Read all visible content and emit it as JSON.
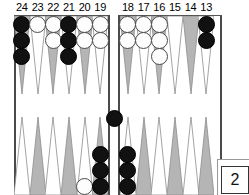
{
  "game": {
    "name": "backgammon-board",
    "board_width": 249,
    "board_height": 195
  },
  "labels": {
    "top_points": [
      "24",
      "23",
      "22",
      "21",
      "20",
      "19",
      "18",
      "17",
      "16",
      "15",
      "14",
      "13"
    ]
  },
  "doubling_cube": {
    "value": "2",
    "name": "doubling-cube"
  },
  "colors": {
    "black_checker": "#111111",
    "white_checker": "#fdfdfd",
    "point_light": "#b5b5b5",
    "point_white": "#ffffff",
    "frame": "#4a4a4a",
    "background": "#ffffff"
  },
  "points": [
    {
      "number": "24",
      "row": "top",
      "slot": 0,
      "color": "black",
      "count": 3
    },
    {
      "number": "23",
      "row": "top",
      "slot": 1,
      "color": "white",
      "count": 1
    },
    {
      "number": "22",
      "row": "top",
      "slot": 2,
      "color": "white",
      "count": 2
    },
    {
      "number": "21",
      "row": "top",
      "slot": 3,
      "color": "black",
      "count": 3
    },
    {
      "number": "20",
      "row": "top",
      "slot": 4,
      "color": "white",
      "count": 2
    },
    {
      "number": "19",
      "row": "top",
      "slot": 5,
      "color": "white",
      "count": 2
    },
    {
      "number": "18",
      "row": "top",
      "slot": 6,
      "color": "white",
      "count": 2
    },
    {
      "number": "17",
      "row": "top",
      "slot": 7,
      "color": "white",
      "count": 2
    },
    {
      "number": "16",
      "row": "top",
      "slot": 8,
      "color": "white",
      "count": 3
    },
    {
      "number": "15",
      "row": "top",
      "slot": 9,
      "color": "none",
      "count": 0
    },
    {
      "number": "14",
      "row": "top",
      "slot": 10,
      "color": "none",
      "count": 0
    },
    {
      "number": "13",
      "row": "top",
      "slot": 11,
      "color": "black",
      "count": 2
    },
    {
      "number": "12",
      "row": "bottom",
      "slot": 0,
      "color": "none",
      "count": 0
    },
    {
      "number": "11",
      "row": "bottom",
      "slot": 1,
      "color": "none",
      "count": 0
    },
    {
      "number": "10",
      "row": "bottom",
      "slot": 2,
      "color": "none",
      "count": 0
    },
    {
      "number": "9",
      "row": "bottom",
      "slot": 3,
      "color": "none",
      "count": 0
    },
    {
      "number": "8",
      "row": "bottom",
      "slot": 4,
      "color": "white",
      "count": 1
    },
    {
      "number": "7",
      "row": "bottom",
      "slot": 5,
      "color": "black",
      "count": 3
    },
    {
      "number": "6",
      "row": "bottom",
      "slot": 6,
      "color": "black",
      "count": 3
    },
    {
      "number": "5",
      "row": "bottom",
      "slot": 7,
      "color": "none",
      "count": 0
    },
    {
      "number": "4",
      "row": "bottom",
      "slot": 8,
      "color": "none",
      "count": 0
    },
    {
      "number": "3",
      "row": "bottom",
      "slot": 9,
      "color": "none",
      "count": 0
    },
    {
      "number": "2",
      "row": "bottom",
      "slot": 10,
      "color": "none",
      "count": 0
    },
    {
      "number": "1",
      "row": "bottom",
      "slot": 11,
      "color": "none",
      "count": 0
    }
  ],
  "bar": {
    "name": "bar-checkers",
    "color": "black",
    "count": 1
  }
}
